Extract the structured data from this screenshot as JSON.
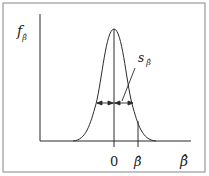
{
  "diagram": {
    "type": "sampling-distribution",
    "y_axis_label": {
      "base": "f",
      "subscript": "β̂"
    },
    "x_axis_label": "β̂",
    "ticks": [
      {
        "label": "0",
        "position": "center"
      },
      {
        "label": "β̂",
        "position": "estimate"
      }
    ],
    "annotation": {
      "base": "s",
      "subscript": "β̂"
    },
    "colors": {
      "line": "#2a2a2a",
      "border": "#9a9a9a",
      "background": "#ffffff"
    }
  }
}
